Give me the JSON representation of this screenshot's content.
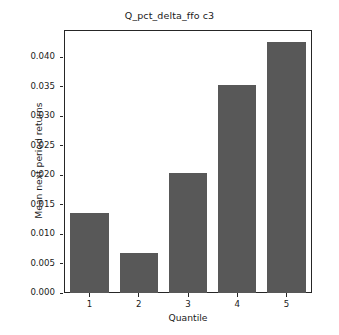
{
  "chart_data": {
    "type": "bar",
    "title": "Q_pct_delta_ffo c3",
    "xlabel": "Quantile",
    "ylabel": "Mean next period returns",
    "categories": [
      "1",
      "2",
      "3",
      "4",
      "5"
    ],
    "values": [
      0.0136,
      0.0068,
      0.0204,
      0.0354,
      0.0427
    ],
    "series": [
      {
        "name": "Mean next period returns",
        "values": [
          0.0136,
          0.0068,
          0.0204,
          0.0354,
          0.0427
        ]
      }
    ],
    "ylim": [
      0.0,
      0.0445
    ],
    "yticks": [
      0.0,
      0.005,
      0.01,
      0.015,
      0.02,
      0.025,
      0.03,
      0.035,
      0.04
    ],
    "ytick_labels": [
      "0.000",
      "0.005",
      "0.010",
      "0.015",
      "0.020",
      "0.025",
      "0.030",
      "0.035",
      "0.040"
    ],
    "xtick_labels": [
      "1",
      "2",
      "3",
      "4",
      "5"
    ],
    "grid": false,
    "legend": null,
    "legend_position": "none",
    "bar_color": "#585858",
    "axis_color": "#262626",
    "text_color": "#1a1a1a",
    "background_color": "#ffffff"
  }
}
